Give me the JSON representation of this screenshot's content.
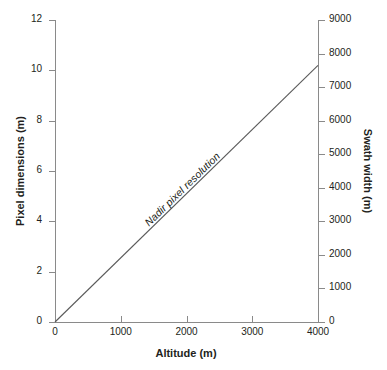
{
  "chart_data": {
    "type": "line",
    "title": "",
    "subtitle": "",
    "xlabel": "Altitude (m)",
    "ylabel": "Pixel dimensions (m)",
    "y2label": "Swath width (m)",
    "xlim": [
      0,
      4000
    ],
    "ylim": [
      0,
      12
    ],
    "y2lim": [
      0,
      9000
    ],
    "grid": false,
    "legend": null,
    "xticks": [
      0,
      1000,
      2000,
      3000,
      4000
    ],
    "xticklabels": [
      "0",
      "1000",
      "2000",
      "3000",
      "4000"
    ],
    "yticks": [
      0,
      2,
      4,
      6,
      8,
      10,
      12
    ],
    "yticklabels": [
      "0",
      "2",
      "4",
      "6",
      "8",
      "10",
      "12"
    ],
    "y2ticks": [
      0,
      1000,
      2000,
      3000,
      4000,
      5000,
      6000,
      7000,
      8000,
      9000
    ],
    "y2ticklabels": [
      "0",
      "1000",
      "2000",
      "3000",
      "4000",
      "5000",
      "6000",
      "7000",
      "8000",
      "9000"
    ],
    "series": [
      {
        "name": "Nadir pixel resolution",
        "annotation": "Nadir pixel resolution",
        "color": "#5a5a5a",
        "x": [
          0,
          4000
        ],
        "y": [
          0,
          10.2
        ],
        "y2": [
          0,
          8000
        ]
      }
    ],
    "axis_color": "#8a8a8a",
    "text_color": "#231f20",
    "background": "#ffffff"
  }
}
